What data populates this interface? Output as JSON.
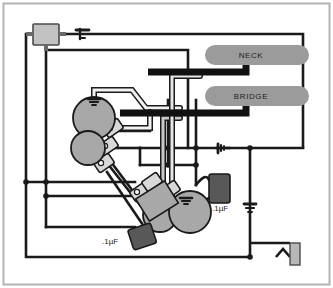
{
  "diagram": {
    "frame_color": "#b4b4b4",
    "background": "#ffffff"
  },
  "palette": {
    "wire_black": "#1a1a1a",
    "wire_white": "#f2f2f2",
    "wire_gray": "#9a9a9a",
    "pickup_body": "#9b9b9b",
    "pickup_lead": "#111111",
    "pot_body": "#a8a8a8",
    "pot_lug": "#d8d8d8",
    "cap_body": "#585858",
    "switch_body": "#c2c2c2",
    "jack_body": "#b8b8b8",
    "text": "#1a1a1a"
  },
  "pickups": [
    {
      "name": "neck-pickup",
      "label": "NECK",
      "x": 205,
      "y": 45,
      "w": 104,
      "h": 20
    },
    {
      "name": "bridge-pickup",
      "label": "BRIDGE",
      "x": 205,
      "y": 86,
      "w": 104,
      "h": 20
    }
  ],
  "capacitors": [
    {
      "name": "tone-cap-bridge",
      "label": ".1µF",
      "x": 209,
      "y": 174,
      "w": 21,
      "h": 29,
      "label_x": 212,
      "label_y": 211
    },
    {
      "name": "tone-cap-neck",
      "label": ".1µF",
      "x": 130,
      "y": 226,
      "w": 24,
      "h": 21,
      "label_x": 103,
      "label_y": 243
    }
  ],
  "pots": [
    {
      "name": "pot-volume-neck",
      "cx": 94,
      "cy": 118,
      "r": 21
    },
    {
      "name": "pot-tone-neck",
      "cx": 88,
      "cy": 148,
      "r": 17
    },
    {
      "name": "pot-volume-bridge",
      "cx": 190,
      "cy": 212,
      "r": 21
    },
    {
      "name": "pot-tone-bridge",
      "cx": 160,
      "cy": 215,
      "r": 17
    }
  ],
  "components": {
    "selector_switch": {
      "name": "pickup-selector-switch",
      "x": 33,
      "y": 24,
      "w": 26,
      "h": 21
    },
    "output_jack": {
      "name": "output-jack",
      "x": 290,
      "y": 248,
      "w": 10,
      "h": 22
    }
  },
  "ground_symbols": [
    {
      "name": "ground-symbol-switch-lead",
      "x": 85,
      "y": 33
    },
    {
      "name": "ground-symbol-center-bus",
      "x": 222,
      "y": 153
    },
    {
      "name": "ground-symbol-right-bus",
      "x": 250,
      "y": 205
    },
    {
      "name": "ground-symbol-pot-volume-neck",
      "x": 94,
      "y": 102
    },
    {
      "name": "ground-symbol-pot-volume-bridge",
      "x": 186,
      "y": 200
    }
  ]
}
